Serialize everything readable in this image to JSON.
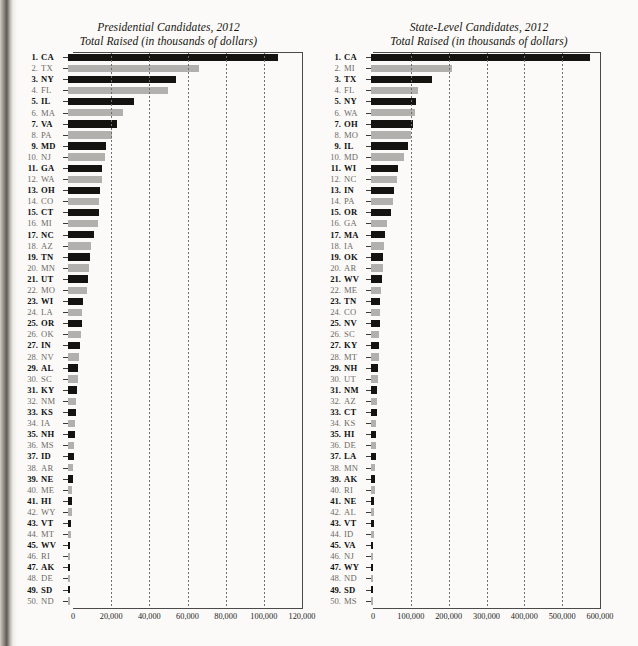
{
  "figure": {
    "page_type": "scanned-book-figure",
    "charts": [
      {
        "id": "presidential",
        "title_line1": "Presidential Candidates, 2012",
        "title_line2": "Total Raised (in thousands of dollars)",
        "chart_data": {
          "type": "bar",
          "orientation": "horizontal",
          "title": "Presidential Candidates, 2012",
          "subtitle": "Total Raised (in thousands of dollars)",
          "xlabel": "Total Raised (in thousands of dollars)",
          "ylabel": "",
          "xlim": [
            0,
            120000
          ],
          "grid": true,
          "legend": false,
          "xticks": [
            0,
            20000,
            40000,
            60000,
            80000,
            100000,
            120000
          ],
          "xticklabels": [
            "0",
            "20,000",
            "40,000",
            "60,000",
            "80,000",
            "100,000",
            "120,000"
          ],
          "categories": [
            "CA",
            "TX",
            "NY",
            "FL",
            "IL",
            "MA",
            "VA",
            "PA",
            "MD",
            "NJ",
            "GA",
            "WA",
            "OH",
            "CO",
            "CT",
            "MI",
            "NC",
            "AZ",
            "TN",
            "MN",
            "UT",
            "MO",
            "WI",
            "LA",
            "OR",
            "OK",
            "IN",
            "NV",
            "AL",
            "SC",
            "KY",
            "NM",
            "KS",
            "IA",
            "NH",
            "MS",
            "ID",
            "AR",
            "NE",
            "ME",
            "HI",
            "WY",
            "VT",
            "MT",
            "WV",
            "RI",
            "AK",
            "DE",
            "SD",
            "ND"
          ],
          "values": [
            110300,
            68500,
            56800,
            52500,
            34500,
            28800,
            25600,
            23200,
            19800,
            19200,
            17900,
            17600,
            16900,
            16500,
            16100,
            15700,
            13400,
            12100,
            11600,
            11200,
            10300,
            9900,
            7900,
            7500,
            7200,
            6800,
            6100,
            5700,
            5300,
            5000,
            4700,
            4400,
            4100,
            3800,
            3500,
            3200,
            3000,
            2700,
            2500,
            2300,
            2100,
            1900,
            1700,
            1500,
            1300,
            1200,
            1000,
            900,
            700,
            500
          ]
        }
      },
      {
        "id": "state-level",
        "title_line1": "State-Level Candidates, 2012",
        "title_line2": "Total Raised (in thousands of dollars)",
        "chart_data": {
          "type": "bar",
          "orientation": "horizontal",
          "title": "State-Level Candidates, 2012",
          "subtitle": "Total Raised (in thousands of dollars)",
          "xlabel": "Total Raised (in thousands of dollars)",
          "ylabel": "",
          "xlim": [
            0,
            600000
          ],
          "grid": true,
          "legend": false,
          "xticks": [
            0,
            100000,
            200000,
            300000,
            400000,
            500000,
            600000
          ],
          "xticklabels": [
            "0",
            "100,000",
            "200,000",
            "300,000",
            "400,000",
            "500,000",
            "600,000"
          ],
          "categories": [
            "CA",
            "MI",
            "TX",
            "FL",
            "NY",
            "WA",
            "OH",
            "MO",
            "IL",
            "MD",
            "WI",
            "NC",
            "IN",
            "PA",
            "OR",
            "GA",
            "MA",
            "IA",
            "OK",
            "AR",
            "WV",
            "ME",
            "TN",
            "CO",
            "NV",
            "SC",
            "KY",
            "MT",
            "NH",
            "UT",
            "NM",
            "AZ",
            "CT",
            "KS",
            "HI",
            "DE",
            "LA",
            "MN",
            "AK",
            "RI",
            "NE",
            "AL",
            "VT",
            "ID",
            "VA",
            "NJ",
            "WY",
            "ND",
            "SD",
            "MS"
          ],
          "values": [
            580000,
            215000,
            160000,
            125000,
            118000,
            115000,
            110000,
            105000,
            98000,
            88000,
            72000,
            68000,
            62000,
            58000,
            54000,
            42000,
            38000,
            35000,
            33000,
            31000,
            29000,
            27000,
            25000,
            24000,
            23000,
            22000,
            21000,
            20000,
            19000,
            18000,
            17000,
            16000,
            15000,
            14000,
            13000,
            12500,
            12000,
            11000,
            10000,
            9500,
            9000,
            8500,
            8000,
            7000,
            6000,
            5500,
            5000,
            4500,
            4000,
            3000
          ]
        }
      }
    ]
  }
}
